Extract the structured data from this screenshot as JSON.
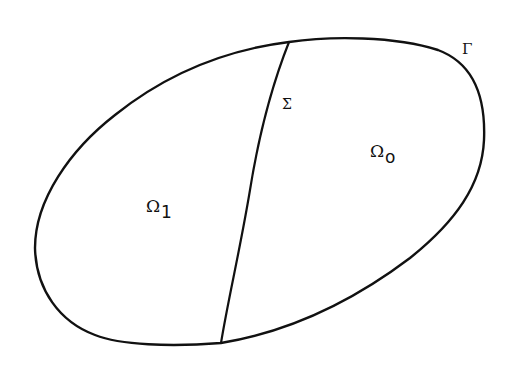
{
  "figure": {
    "stroke_color": "#111111",
    "background": "#ffffff"
  },
  "labels": {
    "boundary": {
      "symbol": "Γ"
    },
    "interface": {
      "symbol": "Σ"
    },
    "region_right": {
      "symbol": "Ω",
      "subscript": "o"
    },
    "region_left": {
      "symbol": "Ω",
      "subscript": "1"
    }
  }
}
